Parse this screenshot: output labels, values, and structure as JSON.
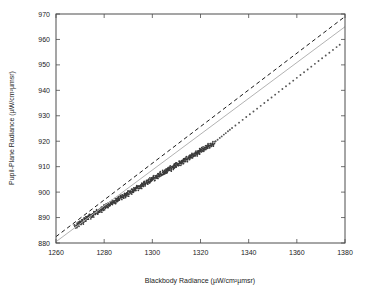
{
  "chart_data": {
    "type": "scatter",
    "title": "",
    "xlabel": "Blackbody Radiance (µW/cm²µmsr)",
    "ylabel": "Pupil-Plane Radiance (µW/cm²µmsr)",
    "xlim": [
      1260,
      1380
    ],
    "ylim": [
      880,
      970
    ],
    "xticks": [
      1260,
      1280,
      1300,
      1320,
      1340,
      1360,
      1380
    ],
    "yticks": [
      880,
      890,
      900,
      910,
      920,
      930,
      940,
      950,
      960,
      970
    ],
    "xtick_labels": [
      "1260",
      "1280",
      "1300",
      "1320",
      "1340",
      "1360",
      "1380"
    ],
    "ytick_labels": [
      "880",
      "890",
      "900",
      "910",
      "920",
      "930",
      "940",
      "950",
      "960",
      "970"
    ],
    "grid": false,
    "legend": null,
    "colors": {
      "points": "#3a3a3a",
      "fit_line": "#b3b3b3",
      "reference_line": "#1a1a1a",
      "frame": "#4d4d4d",
      "text": "#1a1a1a",
      "background": "#ffffff"
    },
    "series": [
      {
        "name": "fit-line",
        "type": "line",
        "style": "solid",
        "color": "#b3b3b3",
        "x": [
          1260,
          1380
        ],
        "y": [
          880.5,
          965.0
        ]
      },
      {
        "name": "reference-line",
        "type": "line",
        "style": "dashed",
        "color": "#1a1a1a",
        "x": [
          1260,
          1380
        ],
        "y": [
          882.5,
          969.0
        ]
      },
      {
        "name": "measurements",
        "type": "scatter",
        "color": "#3a3a3a",
        "marker": "dot",
        "x": [
          1268.2,
          1268.9,
          1269.4,
          1269.8,
          1270.3,
          1270.7,
          1271.2,
          1271.6,
          1272.1,
          1272.5,
          1273.0,
          1273.4,
          1273.9,
          1274.3,
          1274.8,
          1275.2,
          1275.7,
          1276.1,
          1276.6,
          1277.0,
          1277.5,
          1277.9,
          1278.4,
          1278.8,
          1279.3,
          1279.7,
          1280.2,
          1280.6,
          1281.1,
          1281.5,
          1282.0,
          1282.4,
          1282.9,
          1283.3,
          1283.8,
          1284.2,
          1284.7,
          1285.1,
          1285.6,
          1286.0,
          1286.5,
          1286.9,
          1287.4,
          1287.8,
          1288.3,
          1288.7,
          1289.2,
          1289.6,
          1290.1,
          1290.5,
          1291.0,
          1291.4,
          1291.9,
          1292.3,
          1292.8,
          1293.2,
          1293.7,
          1294.1,
          1294.6,
          1295.0,
          1295.5,
          1295.9,
          1296.4,
          1296.8,
          1297.3,
          1297.7,
          1298.2,
          1298.6,
          1299.1,
          1299.5,
          1300.0,
          1300.4,
          1300.9,
          1301.3,
          1301.8,
          1302.2,
          1302.7,
          1303.1,
          1303.6,
          1304.0,
          1304.5,
          1304.9,
          1305.4,
          1305.8,
          1306.3,
          1306.7,
          1307.2,
          1307.6,
          1308.1,
          1308.5,
          1309.0,
          1309.4,
          1309.9,
          1310.3,
          1310.8,
          1311.2,
          1311.7,
          1312.1,
          1312.6,
          1313.0,
          1313.5,
          1313.9,
          1314.4,
          1314.8,
          1315.3,
          1315.7,
          1316.2,
          1316.6,
          1317.1,
          1317.5,
          1318.0,
          1318.4,
          1318.9,
          1319.3,
          1319.8,
          1320.2,
          1320.7,
          1321.1,
          1321.6,
          1322.0,
          1322.5,
          1322.9,
          1323.4,
          1323.8,
          1324.3,
          1324.7,
          1325.4,
          1326.3,
          1327.1,
          1328.0,
          1328.8,
          1329.7,
          1330.5,
          1331.4,
          1332.2,
          1333.1,
          1334.5,
          1336.0,
          1337.5,
          1339.0,
          1340.5,
          1342.0,
          1343.5,
          1345.0,
          1346.5,
          1348.0,
          1349.5,
          1351.0,
          1352.5,
          1354.0,
          1355.5,
          1357.0,
          1358.5,
          1360.0,
          1361.5,
          1363.0,
          1364.5,
          1366.0,
          1367.5,
          1369.0,
          1370.5,
          1372.0,
          1373.5,
          1375.0,
          1376.5,
          1377.8
        ],
        "y": [
          886.5,
          887.3,
          887.1,
          887.9,
          888.2,
          888.0,
          888.8,
          889.1,
          889.4,
          889.2,
          889.9,
          890.3,
          890.1,
          890.7,
          891.0,
          890.8,
          891.5,
          891.8,
          892.1,
          891.9,
          892.6,
          892.9,
          892.7,
          893.4,
          893.6,
          893.4,
          894.1,
          894.4,
          894.2,
          894.9,
          895.2,
          895.0,
          895.6,
          895.9,
          896.2,
          896.0,
          896.7,
          897.0,
          896.8,
          897.4,
          897.7,
          897.5,
          898.2,
          898.5,
          898.3,
          899.0,
          899.2,
          899.0,
          899.7,
          900.0,
          899.8,
          900.5,
          900.7,
          900.5,
          901.2,
          901.5,
          901.3,
          902.0,
          902.2,
          902.0,
          902.7,
          903.0,
          902.8,
          903.5,
          903.7,
          903.5,
          904.2,
          904.5,
          904.3,
          905.0,
          905.2,
          905.0,
          905.7,
          906.0,
          905.8,
          906.5,
          906.7,
          906.5,
          907.2,
          907.5,
          907.3,
          908.0,
          908.2,
          908.0,
          908.7,
          909.0,
          908.8,
          909.5,
          909.7,
          909.5,
          910.2,
          910.5,
          910.3,
          911.0,
          911.2,
          911.0,
          911.7,
          912.0,
          911.8,
          912.5,
          912.7,
          912.5,
          913.2,
          913.5,
          913.3,
          914.0,
          914.2,
          914.0,
          914.7,
          915.0,
          914.8,
          915.5,
          915.7,
          915.5,
          916.2,
          916.5,
          916.3,
          917.0,
          917.2,
          917.0,
          917.7,
          918.0,
          917.8,
          918.5,
          918.7,
          918.5,
          919.3,
          920.0,
          920.6,
          921.3,
          921.9,
          922.6,
          923.2,
          923.9,
          924.5,
          925.2,
          926.2,
          927.3,
          928.4,
          929.5,
          930.6,
          931.7,
          932.8,
          933.9,
          935.0,
          936.1,
          937.2,
          938.3,
          939.4,
          940.5,
          941.6,
          942.7,
          943.8,
          944.9,
          946.0,
          947.1,
          948.2,
          949.3,
          950.4,
          951.5,
          952.6,
          953.7,
          954.8,
          955.9,
          957.0,
          957.9
        ]
      }
    ]
  }
}
